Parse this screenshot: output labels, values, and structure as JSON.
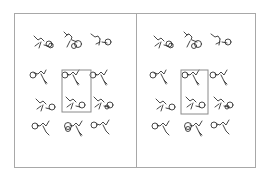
{
  "figure": {
    "type": "crystal-packing-stereo-pair",
    "panels": [
      {
        "name": "left-view",
        "unit_cell": {
          "x": 62,
          "y": 70,
          "w": 29,
          "h": 42
        }
      },
      {
        "name": "right-view",
        "unit_cell": {
          "x": 181,
          "y": 70,
          "w": 27,
          "h": 44
        }
      }
    ],
    "colors": {
      "frame": "#a8a8a8",
      "molecule": "#333333",
      "cell": "#8a8a8a",
      "background": "#ffffff"
    }
  }
}
